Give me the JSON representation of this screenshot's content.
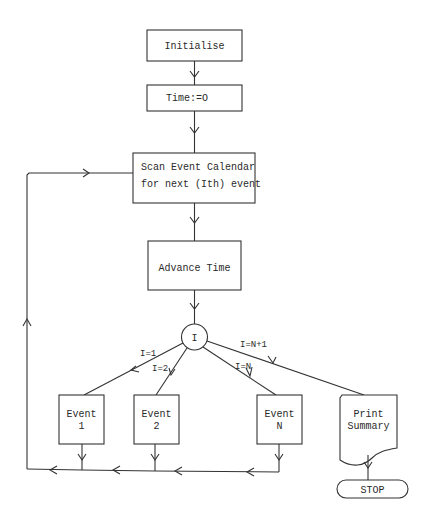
{
  "diagram": {
    "type": "flowchart",
    "nodes": {
      "initialise": {
        "label": "Initialise"
      },
      "time_zero": {
        "label": "Time:=O"
      },
      "scan": {
        "line1": "Scan Event Calendar",
        "line2": "for next (Ith) event"
      },
      "advance": {
        "label": "Advance Time"
      },
      "decision": {
        "label": "I"
      },
      "event1": {
        "line1": "Event",
        "line2": "1"
      },
      "event2": {
        "line1": "Event",
        "line2": "2"
      },
      "eventN": {
        "line1": "Event",
        "line2": "N"
      },
      "print": {
        "line1": "Print",
        "line2": "Summary"
      },
      "stop": {
        "label": "STOP"
      }
    },
    "edge_labels": {
      "to_event1": "I=1",
      "to_event2": "I=2",
      "to_eventN": "I=N",
      "to_print": "I=N+1"
    },
    "colors": {
      "line": "#333333",
      "text": "#2a2a2a",
      "background": "#ffffff"
    }
  }
}
